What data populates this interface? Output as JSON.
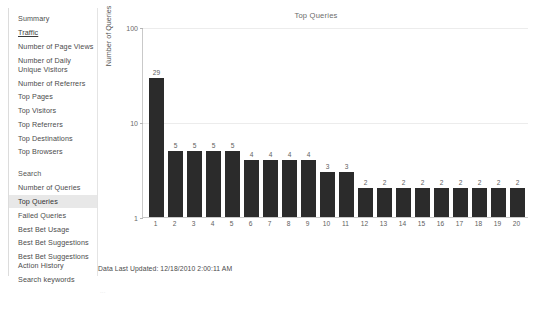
{
  "sidebar": {
    "items": [
      {
        "label": "Summary",
        "kind": "plain",
        "selected": false
      },
      {
        "label": "Traffic",
        "kind": "underline",
        "selected": false
      },
      {
        "label": "Number of Page Views",
        "kind": "plain",
        "selected": false
      },
      {
        "label": "Number of Daily Unique Visitors",
        "kind": "plain",
        "selected": false
      },
      {
        "label": "Number of Referrers",
        "kind": "plain",
        "selected": false
      },
      {
        "label": "Top Pages",
        "kind": "plain",
        "selected": false
      },
      {
        "label": "Top Visitors",
        "kind": "plain",
        "selected": false
      },
      {
        "label": "Top Referrers",
        "kind": "plain",
        "selected": false
      },
      {
        "label": "Top Destinations",
        "kind": "plain",
        "selected": false
      },
      {
        "label": "Top Browsers",
        "kind": "plain",
        "selected": false
      },
      {
        "label": "Search",
        "kind": "heading",
        "selected": false
      },
      {
        "label": "Number of Queries",
        "kind": "plain",
        "selected": false
      },
      {
        "label": "Top Queries",
        "kind": "plain",
        "selected": true
      },
      {
        "label": "Failed Queries",
        "kind": "plain",
        "selected": false
      },
      {
        "label": "Best Bet Usage",
        "kind": "plain",
        "selected": false
      },
      {
        "label": "Best Bet Suggestions",
        "kind": "plain",
        "selected": false
      },
      {
        "label": "Best Bet Suggestions Action History",
        "kind": "plain",
        "selected": false
      },
      {
        "label": "Search keywords",
        "kind": "plain",
        "selected": false
      }
    ],
    "selected_background": "#e8e8e8"
  },
  "footer": {
    "last_updated": "Data Last Updated: 12/18/2010 2:00:11 AM",
    "sub_text": "..."
  },
  "chart_data": {
    "type": "bar",
    "title": "Top Queries",
    "xlabel": "",
    "ylabel": "Number of Queries",
    "yscale": "log",
    "ylim": [
      1,
      100
    ],
    "ytick_labels": [
      "1",
      "10",
      "100"
    ],
    "ytick_values": [
      1,
      10,
      100
    ],
    "grid": true,
    "legend": "none",
    "bar_color": "#2b2b2b",
    "categories": [
      "1",
      "2",
      "3",
      "4",
      "5",
      "6",
      "7",
      "8",
      "9",
      "10",
      "11",
      "12",
      "13",
      "14",
      "15",
      "16",
      "17",
      "18",
      "19",
      "20"
    ],
    "values": [
      29,
      5,
      5,
      5,
      5,
      4,
      4,
      4,
      4,
      3,
      3,
      2,
      2,
      2,
      2,
      2,
      2,
      2,
      2,
      2
    ],
    "data_labels": [
      "29",
      "5",
      "5",
      "5",
      "5",
      "4",
      "4",
      "4",
      "4",
      "3",
      "3",
      "2",
      "2",
      "2",
      "2",
      "2",
      "2",
      "2",
      "2",
      "2"
    ]
  }
}
